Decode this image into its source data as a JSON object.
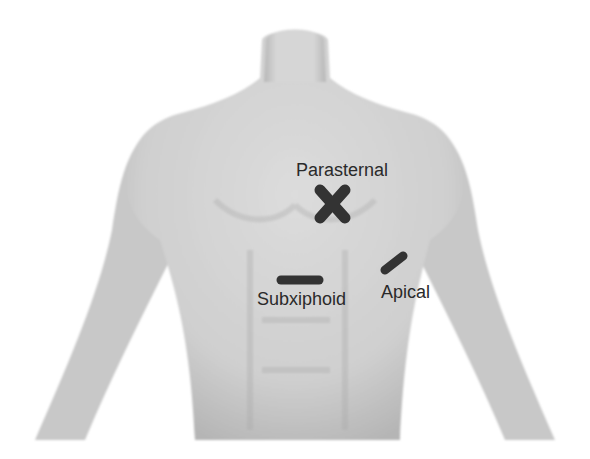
{
  "figure": {
    "probe_color": "#333333",
    "body_color": "#d4d4d4",
    "background": "#ffffff"
  },
  "views": [
    {
      "id": "parasternal",
      "label": "Parasternal",
      "marker": "cross"
    },
    {
      "id": "subxiphoid",
      "label": "Subxiphoid",
      "marker": "horizontal-bar"
    },
    {
      "id": "apical",
      "label": "Apical",
      "marker": "diagonal-bar"
    }
  ]
}
